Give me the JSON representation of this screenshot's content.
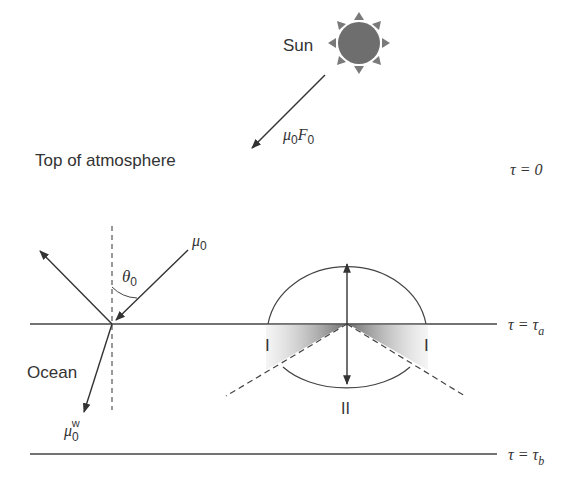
{
  "labels": {
    "sun": "Sun",
    "incident_flux_mu": "μ",
    "incident_flux_sub": "0",
    "incident_flux_F": "F",
    "incident_flux_F_sub": "0",
    "top_of_atmosphere": "Top of atmosphere",
    "tau_zero": "τ = 0",
    "mu0_mu": "μ",
    "mu0_sub": "0",
    "theta0": "θ",
    "theta0_sub": "0",
    "ocean": "Ocean",
    "mu0w_mu": "μ",
    "mu0w_sub": "0",
    "mu0w_sup": "w",
    "tau_a_prefix": "τ = τ",
    "tau_a_sub": "a",
    "tau_b_prefix": "τ = τ",
    "tau_b_sub": "b",
    "region_I_left": "I",
    "region_I_right": "I",
    "region_II": "II"
  },
  "colors": {
    "line": "#444444",
    "sun_fill": "#6e6e6e",
    "sun_rays": "#7a7a7a",
    "shade": "#777777",
    "text": "#333333"
  }
}
